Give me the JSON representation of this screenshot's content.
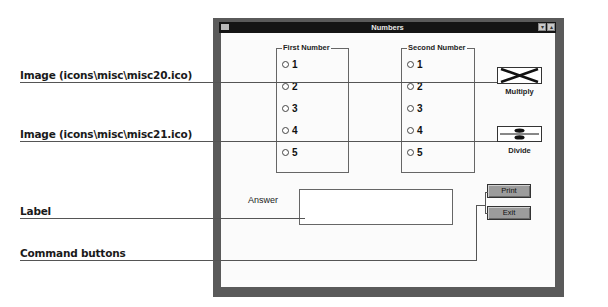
{
  "callouts": [
    {
      "id": "image1",
      "text": "Image (icons\\misc\\misc20.ico)"
    },
    {
      "id": "image2",
      "text": "Image (icons\\misc\\misc21.ico)"
    },
    {
      "id": "label",
      "text": "Label"
    },
    {
      "id": "command",
      "text": "Command buttons"
    }
  ],
  "window": {
    "title": "Numbers",
    "sysmenu_icon": "system-menu-icon",
    "minimize_icon": "minimize-icon",
    "maximize_icon": "maximize-icon"
  },
  "first_group": {
    "label": "First Number",
    "options": [
      "1",
      "2",
      "3",
      "4",
      "5"
    ]
  },
  "second_group": {
    "label": "Second Number",
    "options": [
      "1",
      "2",
      "3",
      "4",
      "5"
    ]
  },
  "images": [
    {
      "icon": "multiply-x-icon",
      "label": "Multiply"
    },
    {
      "icon": "divide-icon",
      "label": "Divide"
    }
  ],
  "answer": {
    "label": "Answer",
    "value": ""
  },
  "buttons": {
    "print": "Print",
    "exit": "Exit"
  }
}
